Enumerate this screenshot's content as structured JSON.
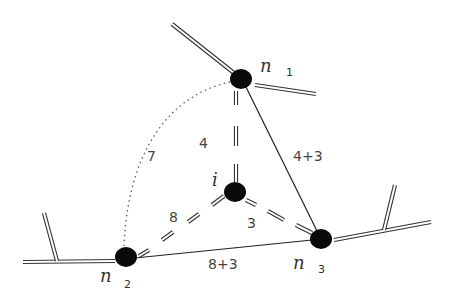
{
  "diagram": {
    "nodes": [
      {
        "id": "n1",
        "label": "n",
        "subscript": "1",
        "x": 241,
        "y": 79
      },
      {
        "id": "n2",
        "label": "n",
        "subscript": "2",
        "x": 126,
        "y": 257
      },
      {
        "id": "n3",
        "label": "n",
        "subscript": "3",
        "x": 321,
        "y": 239
      },
      {
        "id": "i",
        "label": "i",
        "subscript": "",
        "x": 235,
        "y": 192
      }
    ],
    "edges": [
      {
        "from": "n1",
        "to": "i",
        "style": "dashed-double",
        "label": "4"
      },
      {
        "from": "i",
        "to": "n2",
        "style": "dashed-double",
        "label": "8"
      },
      {
        "from": "i",
        "to": "n3",
        "style": "dashed-double",
        "label": "3"
      },
      {
        "from": "n1",
        "to": "n3",
        "style": "solid",
        "label": "4+3"
      },
      {
        "from": "n2",
        "to": "n3",
        "style": "solid",
        "label": "8+3"
      },
      {
        "from": "n1",
        "to": "n2",
        "style": "dotted",
        "label": "7"
      }
    ],
    "edge_labels": {
      "n1_i": "4",
      "i_n2": "8",
      "i_n3": "3",
      "n1_n3": "4+3",
      "n2_n3": "8+3",
      "n1_n2": "7"
    },
    "node_labels": {
      "n1": {
        "main": "n",
        "sub": "1"
      },
      "n2": {
        "main": "n",
        "sub": "2"
      },
      "n3": {
        "main": "n",
        "sub": "3"
      },
      "i": {
        "main": "i"
      }
    },
    "colors": {
      "node_fill": "#0a0a0a",
      "line": "#333333",
      "background": "#ffffff"
    }
  }
}
